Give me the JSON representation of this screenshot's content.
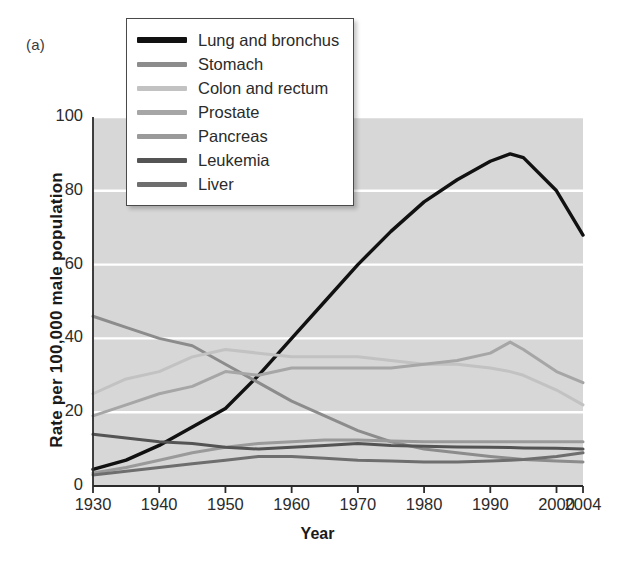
{
  "figure": {
    "panel_label": "(a)",
    "background": "#ffffff",
    "plot_background": "#d7d7d7",
    "gridline_color": "#ffffff",
    "axis_color": "#2b2b2b"
  },
  "axes": {
    "xlabel": "Year",
    "ylabel": "Rate per 100,000 male population",
    "xticks": [
      "1930",
      "1940",
      "1950",
      "1960",
      "1970",
      "1980",
      "1990",
      "2000",
      "2004"
    ],
    "yticks": [
      "0",
      "20",
      "40",
      "60",
      "80",
      "100"
    ]
  },
  "legend": {
    "position": "top-left-inside",
    "entries": [
      {
        "label": "Lung and bronchus",
        "color": "#111111"
      },
      {
        "label": "Stomach",
        "color": "#8c8c8c"
      },
      {
        "label": "Colon and rectum",
        "color": "#c2c2c2"
      },
      {
        "label": "Prostate",
        "color": "#a6a6a6"
      },
      {
        "label": "Pancreas",
        "color": "#9a9a9a"
      },
      {
        "label": "Leukemia",
        "color": "#545454"
      },
      {
        "label": "Liver",
        "color": "#6e6e6e"
      }
    ]
  },
  "chart_data": {
    "type": "line",
    "title": "",
    "subtitle": "",
    "xlabel": "Year",
    "ylabel": "Rate per 100,000 male population",
    "xlim": [
      1930,
      2004
    ],
    "ylim": [
      0,
      100
    ],
    "xticks": [
      1930,
      1940,
      1950,
      1960,
      1970,
      1980,
      1990,
      2000,
      2004
    ],
    "yticks": [
      0,
      20,
      40,
      60,
      80,
      100
    ],
    "grid": "horizontal-white",
    "legend_position": "upper-left",
    "x": [
      1930,
      1935,
      1940,
      1945,
      1950,
      1955,
      1960,
      1965,
      1970,
      1975,
      1980,
      1985,
      1990,
      1993,
      1995,
      2000,
      2004
    ],
    "series": [
      {
        "name": "Lung and bronchus",
        "color": "#111111",
        "values": [
          4.5,
          7,
          11,
          16,
          21,
          30,
          40,
          50,
          60,
          69,
          77,
          83,
          88,
          90,
          89,
          80,
          68
        ]
      },
      {
        "name": "Stomach",
        "color": "#8c8c8c",
        "values": [
          46,
          43,
          40,
          38,
          33,
          28,
          23,
          19,
          15,
          12,
          10,
          9,
          8,
          7.5,
          7.2,
          6.8,
          6.5
        ]
      },
      {
        "name": "Colon and rectum",
        "color": "#c2c2c2",
        "values": [
          25,
          29,
          31,
          35,
          37,
          36,
          35,
          35,
          35,
          34,
          33,
          33,
          32,
          31,
          30,
          26,
          22
        ]
      },
      {
        "name": "Prostate",
        "color": "#a6a6a6",
        "values": [
          19,
          22,
          25,
          27,
          31,
          30,
          32,
          32,
          32,
          32,
          33,
          34,
          36,
          39,
          37,
          31,
          28
        ]
      },
      {
        "name": "Pancreas",
        "color": "#9a9a9a",
        "values": [
          3.5,
          5,
          7,
          9,
          10.5,
          11.5,
          12,
          12.5,
          12.5,
          12.2,
          12,
          12,
          12,
          12,
          12,
          12,
          12
        ]
      },
      {
        "name": "Leukemia",
        "color": "#545454",
        "values": [
          14,
          13,
          12,
          11.5,
          10.5,
          10,
          10.5,
          11,
          11.5,
          11,
          10.8,
          10.6,
          10.5,
          10.4,
          10.3,
          10.2,
          10
        ]
      },
      {
        "name": "Liver",
        "color": "#6e6e6e",
        "values": [
          3,
          4,
          5,
          6,
          7,
          8,
          8,
          7.5,
          7,
          6.8,
          6.5,
          6.5,
          6.8,
          7,
          7.2,
          8,
          9
        ]
      }
    ]
  }
}
